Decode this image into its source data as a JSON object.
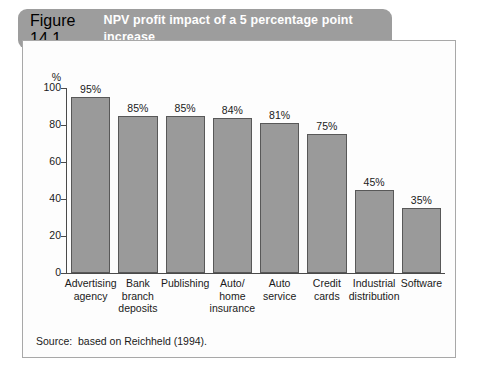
{
  "figure": {
    "number": "Figure 14.1",
    "title_line1": "NPV profit impact of a 5 percentage point increase",
    "title_line2": "in customer retention for selected businesses",
    "banner_color": "#9d9d9d",
    "title_color": "#ffffff"
  },
  "source": {
    "text": "Source:  based on Reichheld (1994)."
  },
  "chart_data": {
    "type": "bar",
    "title": "NPV profit impact of a 5 percentage point increase in customer retention for selected businesses",
    "xlabel": "",
    "ylabel": "%",
    "ylim": [
      0,
      100
    ],
    "yticks": [
      0,
      20,
      40,
      60,
      80,
      100
    ],
    "ytick_labels": [
      "0",
      "20",
      "40",
      "60",
      "80",
      "100"
    ],
    "grid": false,
    "legend": "none",
    "bar_color": "#9a9a9a",
    "bar_edge_color": "#585858",
    "categories": [
      "Advertising agency",
      "Bank branch deposits",
      "Publishing",
      "Auto/ home insurance",
      "Auto service",
      "Credit cards",
      "Industrial distribution",
      "Software"
    ],
    "category_lines": [
      [
        "Advertising",
        "agency"
      ],
      [
        "Bank",
        "branch",
        "deposits"
      ],
      [
        "Publishing"
      ],
      [
        "Auto/",
        "home",
        "insurance"
      ],
      [
        "Auto",
        "service"
      ],
      [
        "Credit",
        "cards"
      ],
      [
        "Industrial",
        "distribution"
      ],
      [
        "Software"
      ]
    ],
    "values": [
      95,
      85,
      85,
      84,
      81,
      75,
      45,
      35
    ],
    "data_labels": [
      "95%",
      "85%",
      "85%",
      "84%",
      "81%",
      "75%",
      "45%",
      "35%"
    ]
  }
}
